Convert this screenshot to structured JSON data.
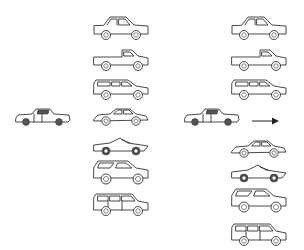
{
  "diagram": {
    "type": "vehicle-classification-illustration",
    "source_vehicle": {
      "label": "query-car",
      "style": "photo-like sketch of a sedan/coupe"
    },
    "middle_column": {
      "items": [
        {
          "class": "sedan"
        },
        {
          "class": "pickup-truck"
        },
        {
          "class": "station-wagon"
        },
        {
          "class": "coupe"
        },
        {
          "class": "sports-car"
        },
        {
          "class": "suv"
        },
        {
          "class": "long-wagon"
        }
      ]
    },
    "right_column": {
      "items": [
        {
          "class": "sedan"
        },
        {
          "class": "pickup-truck"
        },
        {
          "class": "station-wagon"
        },
        {
          "class": "coupe"
        },
        {
          "class": "sports-car"
        },
        {
          "class": "suv"
        },
        {
          "class": "long-wagon"
        }
      ]
    },
    "arrow": {
      "direction": "right",
      "icon": "arrow-right-icon"
    },
    "colors": {
      "background": "#ffffff",
      "line": "#333333"
    }
  }
}
